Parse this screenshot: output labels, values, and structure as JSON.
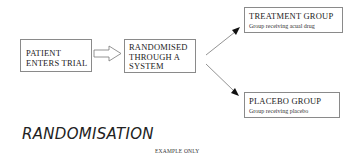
{
  "diagram": {
    "title": "RANDOMISATION",
    "footnote": "EXAMPLE ONLY",
    "nodes": {
      "patient": {
        "label_line1": "PATIENT",
        "label_line2": "ENTERS TRIAL"
      },
      "randomise": {
        "label_line1": "RANDOMISED",
        "label_line2": "THROUGH A",
        "label_line3": "SYSTEM"
      },
      "treatment": {
        "title": "TREATMENT GROUP",
        "subtitle": "Group receiving acual drug"
      },
      "placebo": {
        "title": "PLACEBO GROUP",
        "subtitle": "Group receiving placebo"
      }
    },
    "edges": [
      {
        "from": "patient",
        "to": "randomise",
        "style": "hollow-block-arrow"
      },
      {
        "from": "randomise",
        "to": "treatment",
        "style": "line-arrow"
      },
      {
        "from": "randomise",
        "to": "placebo",
        "style": "line-arrow"
      }
    ],
    "colors": {
      "border": "#8a8a8a",
      "text": "#222222",
      "arrow": "#555555",
      "arrowhead": "#111111"
    }
  }
}
